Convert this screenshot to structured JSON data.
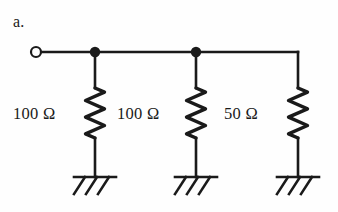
{
  "figure": {
    "label": "a.",
    "background_color": "#fefefe",
    "ink_color": "#1a1a1a",
    "width": 338,
    "height": 212
  },
  "terminal": {
    "name": "open-terminal",
    "shape": "open-circle",
    "x": 36,
    "y": 52,
    "radius": 5
  },
  "bus": {
    "name": "horizontal-bus-wire",
    "y": 52,
    "x_start": 41,
    "x_end": 298
  },
  "nodes": [
    {
      "name": "junction-node-1",
      "x": 95,
      "y": 52,
      "radius": 5.2,
      "filled": true
    },
    {
      "name": "junction-node-2",
      "x": 196,
      "y": 52,
      "radius": 5.2,
      "filled": true
    }
  ],
  "branches": [
    {
      "id": "branch-1",
      "x": 95,
      "label": "100 Ω",
      "value": 100,
      "unit": "Ω",
      "resistor_top": 88,
      "resistor_bottom": 138,
      "ground_y": 177
    },
    {
      "id": "branch-2",
      "x": 196,
      "label": "100 Ω",
      "value": 100,
      "unit": "Ω",
      "resistor_top": 88,
      "resistor_bottom": 138,
      "ground_y": 177
    },
    {
      "id": "branch-3",
      "x": 298,
      "label": "50 Ω",
      "value": 50,
      "unit": "Ω",
      "resistor_top": 88,
      "resistor_bottom": 138,
      "ground_y": 177
    }
  ],
  "ground_symbol": {
    "name": "chassis-ground",
    "bar_half_width": 21,
    "hatch_count": 3,
    "hatch_length": 17,
    "hatch_slant_x": -11
  }
}
